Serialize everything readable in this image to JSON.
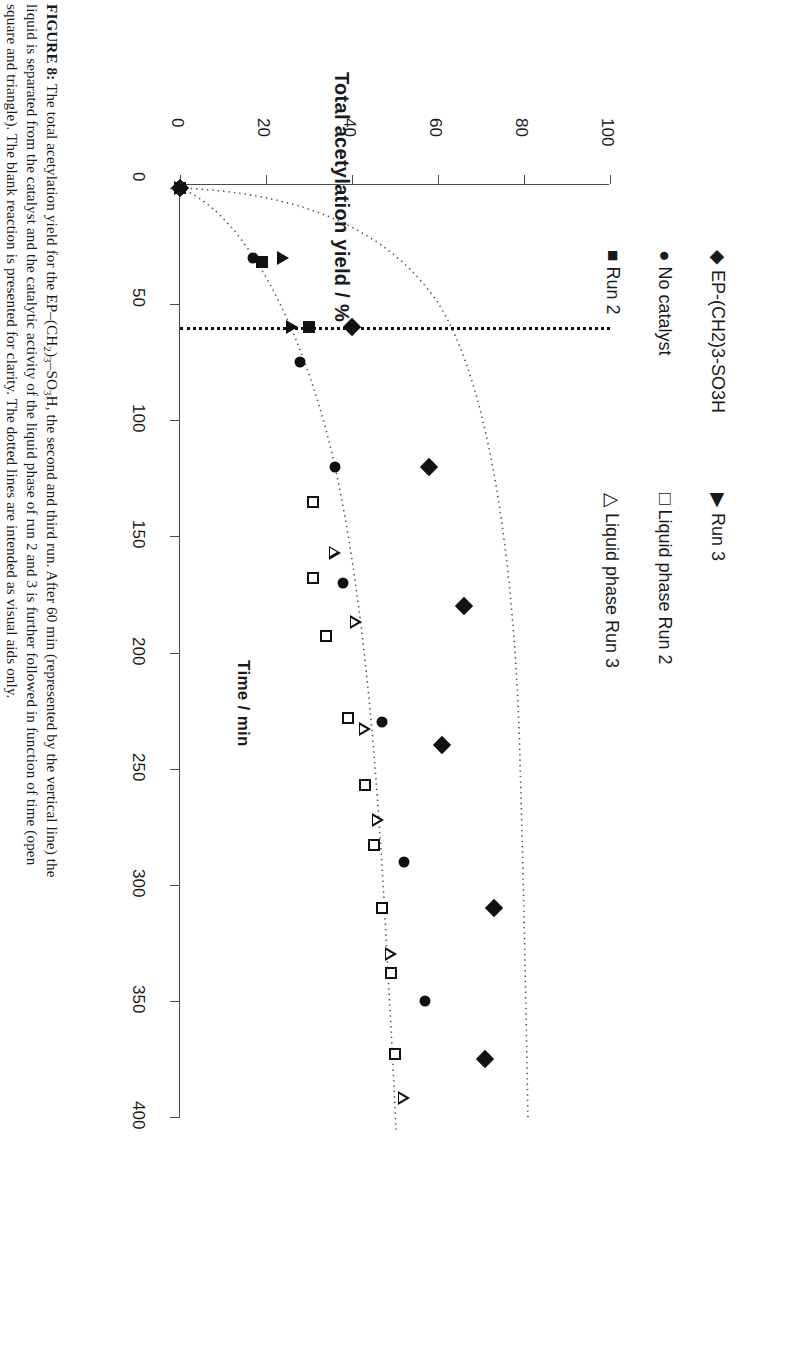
{
  "caption": {
    "label": "FIGURE 8:",
    "line1_a": " The total acetylation yield for the EP–(CH",
    "line1_sub1": "2",
    "line1_b": ")",
    "line1_sub2": "3",
    "line1_c": "–SO",
    "line1_sub3": "3",
    "line1_d": "H, the second and third run. After 60 min (represented by the vertical line) the",
    "line2": "liquid is separated from the catalyst and the catalytic activity of the liquid phase of run 2 and 3 is further followed in function of time (open",
    "line3": "square and triangle). The blank reaction is presented for clarity. The dotted lines are intended as visual aids only."
  },
  "legend": {
    "entries": [
      {
        "glyph": "◆",
        "label": "EP-(CH2)3-SO3H",
        "marker": "filled-diamond"
      },
      {
        "glyph": "●",
        "label": "No catalyst",
        "marker": "filled-circle"
      },
      {
        "glyph": "■",
        "label": "Run 2",
        "marker": "filled-square"
      },
      {
        "glyph": "▶",
        "label": "Run 3",
        "marker": "filled-triangle"
      },
      {
        "glyph": "□",
        "label": "Liquid phase Run 2",
        "marker": "open-square"
      },
      {
        "glyph": "△",
        "label": "Liquid phase Run 3",
        "marker": "open-triangle"
      }
    ]
  },
  "chart_data": {
    "type": "scatter",
    "title": "",
    "xlabel": "Time / min",
    "ylabel": "Total acetylation yield /  %",
    "xlim": [
      0,
      400
    ],
    "ylim": [
      0,
      100
    ],
    "xticks": [
      0,
      50,
      100,
      150,
      200,
      250,
      300,
      350,
      400
    ],
    "yticks": [
      0,
      20,
      40,
      60,
      80,
      100
    ],
    "grid": false,
    "legend_position": "top-right",
    "annotations": [
      {
        "type": "vertical-line",
        "style": "dotted",
        "x": 60,
        "note": "liquid separated from catalyst at 60 min"
      },
      {
        "type": "curve",
        "style": "dotted",
        "note": "visual aid for EP-(CH2)3-SO3H"
      },
      {
        "type": "curve",
        "style": "dotted",
        "note": "visual aid for No catalyst"
      }
    ],
    "series": [
      {
        "name": "EP-(CH2)3-SO3H",
        "marker": "filled-diamond",
        "points": [
          [
            0,
            0
          ],
          [
            60,
            40
          ],
          [
            120,
            58
          ],
          [
            180,
            66
          ],
          [
            240,
            61
          ],
          [
            310,
            73
          ],
          [
            375,
            71
          ]
        ]
      },
      {
        "name": "No catalyst",
        "marker": "filled-circle",
        "points": [
          [
            0,
            0
          ],
          [
            30,
            17
          ],
          [
            75,
            28
          ],
          [
            120,
            36
          ],
          [
            170,
            38
          ],
          [
            230,
            47
          ],
          [
            290,
            52
          ],
          [
            350,
            57
          ]
        ]
      },
      {
        "name": "Run 2",
        "marker": "filled-square",
        "points": [
          [
            0,
            0
          ],
          [
            32,
            19
          ],
          [
            60,
            30
          ]
        ]
      },
      {
        "name": "Run 3",
        "marker": "filled-triangle",
        "points": [
          [
            0,
            0
          ],
          [
            30,
            24
          ],
          [
            60,
            26
          ]
        ]
      },
      {
        "name": "Liquid phase Run 2",
        "marker": "open-square",
        "points": [
          [
            135,
            31
          ],
          [
            168,
            31
          ],
          [
            193,
            34
          ],
          [
            228,
            39
          ],
          [
            257,
            43
          ],
          [
            283,
            45
          ],
          [
            310,
            47
          ],
          [
            338,
            49
          ],
          [
            373,
            50
          ]
        ]
      },
      {
        "name": "Liquid phase Run 3",
        "marker": "open-triangle",
        "points": [
          [
            157,
            36
          ],
          [
            187,
            41
          ],
          [
            233,
            43
          ],
          [
            272,
            46
          ],
          [
            330,
            49
          ],
          [
            392,
            52
          ]
        ]
      }
    ]
  }
}
